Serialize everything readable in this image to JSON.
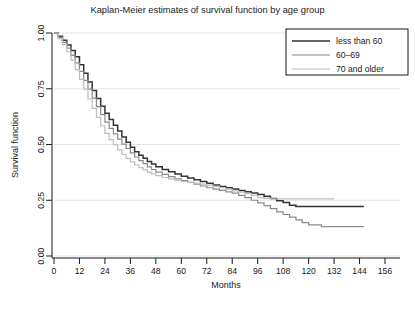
{
  "chart_data": {
    "type": "line",
    "title": "Kaplan-Meier estimates of survival function by age group",
    "xlabel": "Months",
    "ylabel": "Survival function",
    "xlim": [
      0,
      156
    ],
    "ylim": [
      0,
      1.0
    ],
    "xticks": [
      0,
      12,
      24,
      36,
      48,
      60,
      72,
      84,
      96,
      108,
      120,
      132,
      144,
      156
    ],
    "yticks": [
      0.0,
      0.25,
      0.5,
      0.75,
      1.0
    ],
    "ytick_labels": [
      "0.00",
      "0.25",
      "0.50",
      "0.75",
      "1.00"
    ],
    "grid": true,
    "grid_axis": "y",
    "legend_position": "top-right",
    "step_style": "post",
    "series": [
      {
        "name": "less than 60",
        "color": "#333333",
        "width": 1.5,
        "points": [
          [
            0,
            1.0
          ],
          [
            2,
            0.985
          ],
          [
            4,
            0.968
          ],
          [
            6,
            0.946
          ],
          [
            8,
            0.922
          ],
          [
            10,
            0.893
          ],
          [
            12,
            0.858
          ],
          [
            14,
            0.82
          ],
          [
            16,
            0.78
          ],
          [
            18,
            0.742
          ],
          [
            20,
            0.706
          ],
          [
            22,
            0.672
          ],
          [
            24,
            0.64
          ],
          [
            26,
            0.612
          ],
          [
            28,
            0.586
          ],
          [
            30,
            0.56
          ],
          [
            32,
            0.534
          ],
          [
            34,
            0.51
          ],
          [
            36,
            0.488
          ],
          [
            38,
            0.468
          ],
          [
            40,
            0.452
          ],
          [
            42,
            0.438
          ],
          [
            44,
            0.424
          ],
          [
            46,
            0.412
          ],
          [
            48,
            0.4
          ],
          [
            51,
            0.388
          ],
          [
            54,
            0.378
          ],
          [
            57,
            0.368
          ],
          [
            60,
            0.358
          ],
          [
            63,
            0.35
          ],
          [
            66,
            0.342
          ],
          [
            69,
            0.334
          ],
          [
            72,
            0.326
          ],
          [
            75,
            0.318
          ],
          [
            78,
            0.312
          ],
          [
            81,
            0.306
          ],
          [
            84,
            0.3
          ],
          [
            87,
            0.294
          ],
          [
            90,
            0.288
          ],
          [
            93,
            0.282
          ],
          [
            96,
            0.276
          ],
          [
            99,
            0.268
          ],
          [
            102,
            0.258
          ],
          [
            105,
            0.248
          ],
          [
            108,
            0.24
          ],
          [
            111,
            0.228
          ],
          [
            114,
            0.222
          ],
          [
            120,
            0.222
          ],
          [
            132,
            0.222
          ],
          [
            146,
            0.222
          ]
        ]
      },
      {
        "name": "60–69",
        "color": "#8a8a8a",
        "width": 1.2,
        "points": [
          [
            0,
            1.0
          ],
          [
            2,
            0.98
          ],
          [
            4,
            0.958
          ],
          [
            6,
            0.932
          ],
          [
            8,
            0.9
          ],
          [
            10,
            0.866
          ],
          [
            12,
            0.828
          ],
          [
            14,
            0.788
          ],
          [
            16,
            0.748
          ],
          [
            18,
            0.708
          ],
          [
            20,
            0.67
          ],
          [
            22,
            0.634
          ],
          [
            24,
            0.6
          ],
          [
            26,
            0.572
          ],
          [
            28,
            0.548
          ],
          [
            30,
            0.524
          ],
          [
            32,
            0.502
          ],
          [
            34,
            0.482
          ],
          [
            36,
            0.462
          ],
          [
            38,
            0.444
          ],
          [
            40,
            0.428
          ],
          [
            42,
            0.414
          ],
          [
            44,
            0.4
          ],
          [
            46,
            0.388
          ],
          [
            48,
            0.376
          ],
          [
            51,
            0.366
          ],
          [
            54,
            0.356
          ],
          [
            57,
            0.346
          ],
          [
            60,
            0.338
          ],
          [
            63,
            0.33
          ],
          [
            66,
            0.322
          ],
          [
            69,
            0.314
          ],
          [
            72,
            0.306
          ],
          [
            75,
            0.3
          ],
          [
            78,
            0.294
          ],
          [
            81,
            0.288
          ],
          [
            84,
            0.282
          ],
          [
            87,
            0.272
          ],
          [
            90,
            0.262
          ],
          [
            93,
            0.25
          ],
          [
            96,
            0.238
          ],
          [
            99,
            0.226
          ],
          [
            102,
            0.212
          ],
          [
            105,
            0.198
          ],
          [
            108,
            0.186
          ],
          [
            111,
            0.174
          ],
          [
            114,
            0.162
          ],
          [
            117,
            0.15
          ],
          [
            120,
            0.14
          ],
          [
            126,
            0.132
          ],
          [
            132,
            0.132
          ],
          [
            146,
            0.132
          ]
        ]
      },
      {
        "name": "70 and older",
        "color": "#bdbdbd",
        "width": 1.2,
        "points": [
          [
            0,
            1.0
          ],
          [
            2,
            0.975
          ],
          [
            4,
            0.948
          ],
          [
            6,
            0.916
          ],
          [
            8,
            0.878
          ],
          [
            10,
            0.836
          ],
          [
            12,
            0.792
          ],
          [
            14,
            0.748
          ],
          [
            16,
            0.704
          ],
          [
            18,
            0.662
          ],
          [
            20,
            0.622
          ],
          [
            22,
            0.584
          ],
          [
            24,
            0.55
          ],
          [
            26,
            0.522
          ],
          [
            28,
            0.498
          ],
          [
            30,
            0.476
          ],
          [
            32,
            0.456
          ],
          [
            34,
            0.438
          ],
          [
            36,
            0.422
          ],
          [
            38,
            0.408
          ],
          [
            40,
            0.396
          ],
          [
            42,
            0.386
          ],
          [
            44,
            0.376
          ],
          [
            46,
            0.368
          ],
          [
            48,
            0.36
          ],
          [
            51,
            0.352
          ],
          [
            54,
            0.346
          ],
          [
            57,
            0.34
          ],
          [
            60,
            0.334
          ],
          [
            63,
            0.33
          ],
          [
            66,
            0.326
          ],
          [
            69,
            0.322
          ],
          [
            72,
            0.318
          ],
          [
            75,
            0.312
          ],
          [
            78,
            0.306
          ],
          [
            81,
            0.3
          ],
          [
            84,
            0.292
          ],
          [
            87,
            0.286
          ],
          [
            90,
            0.28
          ],
          [
            93,
            0.272
          ],
          [
            96,
            0.262
          ],
          [
            99,
            0.258
          ],
          [
            102,
            0.256
          ],
          [
            108,
            0.256
          ],
          [
            114,
            0.256
          ],
          [
            120,
            0.256
          ],
          [
            126,
            0.256
          ],
          [
            132,
            0.256
          ]
        ]
      }
    ]
  },
  "legend": {
    "items": [
      {
        "label": "less than 60"
      },
      {
        "label": "60–69"
      },
      {
        "label": "70 and older"
      }
    ]
  }
}
